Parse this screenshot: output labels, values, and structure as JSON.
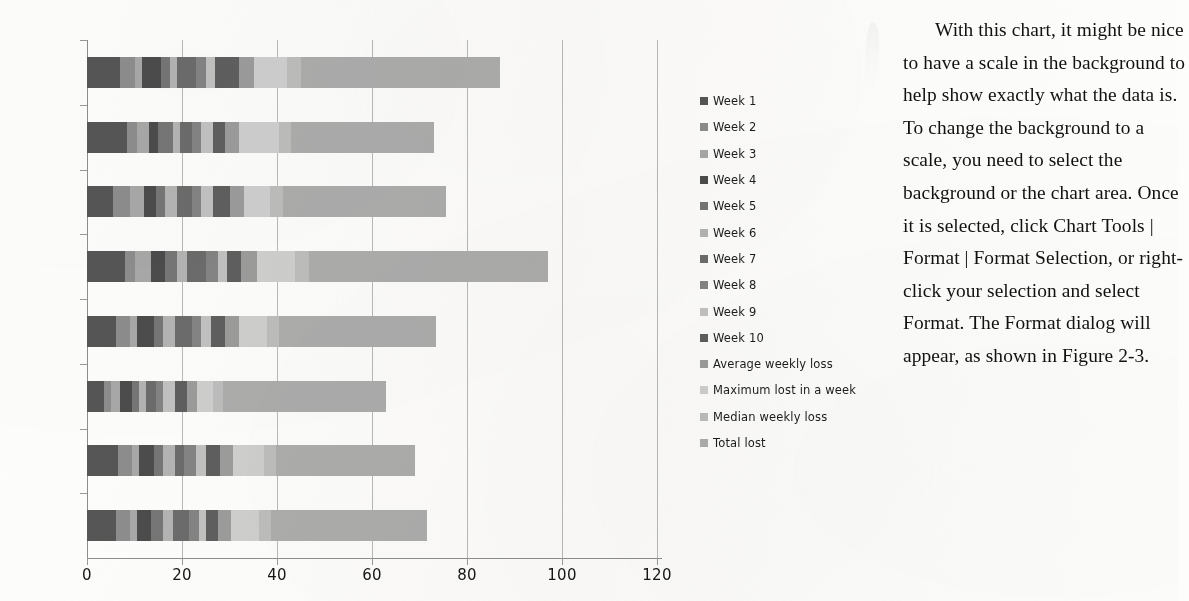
{
  "chart_data": {
    "type": "bar",
    "subtype": "horizontal-stacked-bar",
    "title": "",
    "xlabel": "",
    "ylabel": "",
    "xlim": [
      0,
      120
    ],
    "ylim": null,
    "grid": true,
    "legend_position": "right",
    "x_ticks": [
      "0",
      "20",
      "40",
      "60",
      "80",
      "100",
      "120"
    ],
    "x_tick_values": [
      0,
      20,
      40,
      60,
      80,
      100,
      120
    ],
    "categories": [
      "Michael",
      "Sarah",
      "Linda",
      "Larry",
      "Harry",
      "Mary",
      "John",
      "Jane"
    ],
    "series": [
      {
        "name": "Week 1",
        "color": "#565656",
        "values": [
          7.0,
          8.5,
          5.5,
          8.0,
          6.0,
          3.5,
          6.5,
          6.0
        ]
      },
      {
        "name": "Week 2",
        "color": "#8d8d8d",
        "values": [
          3.0,
          2.0,
          3.5,
          2.0,
          3.0,
          1.5,
          3.0,
          3.0
        ]
      },
      {
        "name": "Week 3",
        "color": "#a8a8a8",
        "values": [
          1.5,
          2.5,
          3.0,
          3.5,
          1.5,
          2.0,
          1.5,
          1.5
        ]
      },
      {
        "name": "Week 4",
        "color": "#4c4c4c",
        "values": [
          4.0,
          2.0,
          2.5,
          3.0,
          3.5,
          2.5,
          3.0,
          3.0
        ]
      },
      {
        "name": "Week 5",
        "color": "#767676",
        "values": [
          2.0,
          3.0,
          2.0,
          2.5,
          2.0,
          1.5,
          2.0,
          2.5
        ]
      },
      {
        "name": "Week 6",
        "color": "#b4b4b4",
        "values": [
          1.5,
          1.5,
          2.5,
          2.0,
          2.5,
          1.5,
          2.5,
          2.0
        ]
      },
      {
        "name": "Week 7",
        "color": "#6c6c6c",
        "values": [
          4.0,
          2.5,
          3.0,
          4.0,
          3.5,
          2.0,
          2.0,
          3.5
        ]
      },
      {
        "name": "Week 8",
        "color": "#848484",
        "values": [
          2.0,
          2.0,
          2.0,
          2.5,
          2.0,
          1.5,
          2.5,
          2.0
        ]
      },
      {
        "name": "Week 9",
        "color": "#c2c2c2",
        "values": [
          2.0,
          2.5,
          2.5,
          2.0,
          2.0,
          2.5,
          2.0,
          1.5
        ]
      },
      {
        "name": "Week 10",
        "color": "#5f5f5f",
        "values": [
          5.0,
          2.5,
          3.5,
          3.0,
          3.0,
          2.5,
          3.0,
          2.5
        ]
      },
      {
        "name": "Average weekly loss",
        "color": "#9c9c9c",
        "values": [
          3.2,
          2.9,
          3.0,
          3.3,
          2.9,
          2.1,
          2.8,
          2.8
        ]
      },
      {
        "name": "Maximum lost in a week",
        "color": "#cfcfcf",
        "values": [
          7.0,
          8.5,
          5.5,
          8.0,
          6.0,
          3.5,
          6.5,
          6.0
        ]
      },
      {
        "name": "Median weekly loss",
        "color": "#bdbdbd",
        "values": [
          2.8,
          2.5,
          2.8,
          3.0,
          2.6,
          2.0,
          2.5,
          2.5
        ]
      },
      {
        "name": "Total lost",
        "color": "#adadad",
        "values": [
          42.0,
          30.1,
          34.2,
          50.2,
          33.0,
          34.4,
          29.2,
          32.7
        ]
      }
    ],
    "totals": [
      87.0,
      71.0,
      75.0,
      98.0,
      73.5,
      63.0,
      69.0,
      71.5
    ]
  },
  "legend": {
    "entries": [
      {
        "label": "Week 1"
      },
      {
        "label": "Week 2"
      },
      {
        "label": "Week 3"
      },
      {
        "label": "Week 4"
      },
      {
        "label": "Week 5"
      },
      {
        "label": "Week 6"
      },
      {
        "label": "Week 7"
      },
      {
        "label": "Week 8"
      },
      {
        "label": "Week 9"
      },
      {
        "label": "Week 10"
      },
      {
        "label": "Average weekly loss"
      },
      {
        "label": "Maximum lost in a week"
      },
      {
        "label": "Median weekly loss"
      },
      {
        "label": "Total lost"
      }
    ]
  },
  "body_text": {
    "paragraph": "With this chart, it might be nice to have a scale in the background to help show exactly what the data is. To change the background to a scale, you need to select the background or the chart area. Once it is selected, click Chart Tools | Format | Format Selection, or right-click your selection and select Format. The Format dialog will appear, as shown in Figure 2-3."
  }
}
